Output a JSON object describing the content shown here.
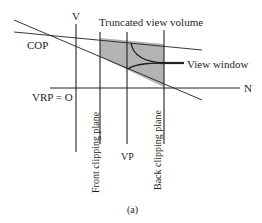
{
  "figure": {
    "caption": "(a)",
    "labels": {
      "v_axis": "V",
      "n_axis": "N",
      "cop": "COP",
      "vrp": "VRP = O",
      "truncated_view_volume": "Truncated view volume",
      "view_window": "View window",
      "vp": "VP",
      "front_clipping_plane": "Front clipping plane",
      "back_clipping_plane": "Back clipping plane"
    },
    "colors": {
      "line": "#231f20",
      "volume_fill": "#b3b3b3",
      "background": "#ffffff"
    }
  }
}
